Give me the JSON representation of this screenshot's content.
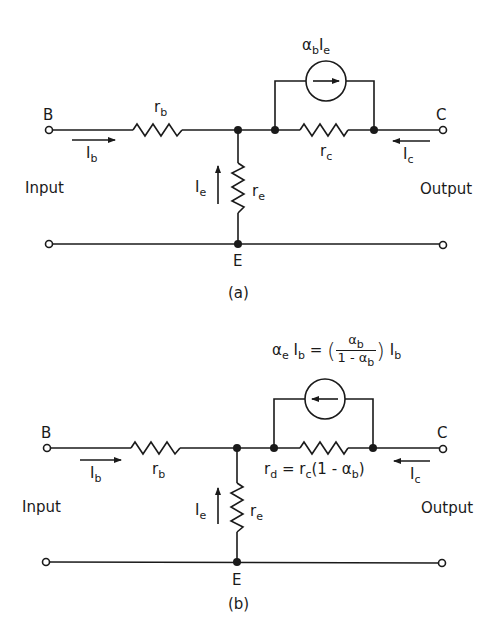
{
  "figure": {
    "panels": [
      {
        "id": "a",
        "caption": "(a)",
        "nodes": {
          "base": "B",
          "collector": "C",
          "emitter": "E"
        },
        "ports": {
          "input": "Input",
          "output": "Output"
        },
        "components": {
          "base_resistor": {
            "symbol": "r",
            "sub": "b"
          },
          "emitter_resistor": {
            "symbol": "r",
            "sub": "e"
          },
          "collector_resistor": {
            "symbol": "r",
            "sub": "c"
          },
          "current_source": {
            "label_alpha": "α",
            "alpha_sub": "b",
            "label_I": "I",
            "I_sub": "e",
            "arrow_direction": "right"
          }
        },
        "currents": {
          "base": {
            "symbol": "I",
            "sub": "b",
            "direction": "right"
          },
          "emitter": {
            "symbol": "I",
            "sub": "e",
            "direction": "up"
          },
          "collector": {
            "symbol": "I",
            "sub": "c",
            "direction": "left"
          }
        }
      },
      {
        "id": "b",
        "caption": "(b)",
        "nodes": {
          "base": "B",
          "collector": "C",
          "emitter": "E"
        },
        "ports": {
          "input": "Input",
          "output": "Output"
        },
        "components": {
          "base_resistor": {
            "symbol": "r",
            "sub": "b"
          },
          "emitter_resistor": {
            "symbol": "r",
            "sub": "e"
          },
          "collector_resistor": {
            "lhs": "r",
            "lhs_sub": "d",
            "eq": " = ",
            "rhs_r": "r",
            "rhs_sub": "c",
            "rhs_tail_open": "(1 - α",
            "rhs_tail_sub": "b",
            "rhs_tail_close": ")"
          },
          "current_source": {
            "lhs_alpha": "α",
            "lhs_alpha_sub": "e",
            "lhs_I": " I",
            "lhs_I_sub": "b",
            "eq": " = ",
            "paren_open": "(",
            "frac_num": "α",
            "frac_num_sub": "b",
            "frac_den": "1 - α",
            "frac_den_sub": "b",
            "paren_close": ")",
            "tail_I": " I",
            "tail_I_sub": "b",
            "arrow_direction": "left"
          }
        },
        "currents": {
          "base": {
            "symbol": "I",
            "sub": "b",
            "direction": "right"
          },
          "emitter": {
            "symbol": "I",
            "sub": "e",
            "direction": "up"
          },
          "collector": {
            "symbol": "I",
            "sub": "c",
            "direction": "left"
          }
        }
      }
    ]
  }
}
